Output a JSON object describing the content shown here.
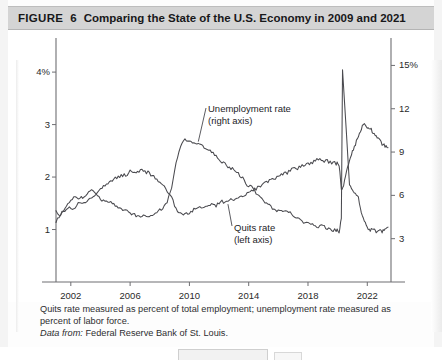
{
  "figure": {
    "label": "FIGURE",
    "number": "6",
    "title": "Comparing the State of the U.S. Economy in 2009 and 2021"
  },
  "caption": {
    "note": "Quits rate measured as percent of total employment; unemployment rate measured as percent of labor force.",
    "source_prefix": "Data from:",
    "source": "Federal Reserve Bank of St. Louis."
  },
  "annotations": {
    "unemployment": {
      "line1": "Unemployment rate",
      "line2": "(right axis)"
    },
    "quits": {
      "line1": "Quits rate",
      "line2": "(left axis)"
    }
  },
  "colors": {
    "header_bg": "#d4d4d4",
    "line": "#4a4a4f",
    "axis": "#6e6e72",
    "text": "#18181a"
  },
  "chart_data": {
    "type": "line",
    "title": "Comparing the State of the U.S. Economy in 2009 and 2021",
    "xlabel": "",
    "ylabel_left": "Quits rate (% of total employment)",
    "ylabel_right": "Unemployment rate (% of labor force)",
    "grid": false,
    "legend": "inline-annotations",
    "xlim": [
      2001.0,
      2023.6
    ],
    "xticks": [
      "2002",
      "2006",
      "2010",
      "2014",
      "2018",
      "2022"
    ],
    "xtick_values": [
      2002,
      2006,
      2010,
      2014,
      2018,
      2022
    ],
    "left_axis": {
      "ticks": [
        "4%",
        "3",
        "2",
        "1"
      ],
      "tick_values": [
        4,
        3,
        2,
        1
      ],
      "ylim": [
        0,
        4.65
      ]
    },
    "right_axis": {
      "ticks": [
        "15%",
        "12",
        "9",
        "6",
        "3"
      ],
      "tick_values": [
        15,
        12,
        9,
        6,
        3
      ],
      "ylim": [
        0,
        16.9
      ]
    },
    "series": [
      {
        "name": "Quits rate (left axis)",
        "axis": "left",
        "units": "percent of total employment",
        "x": [
          2001.0,
          2001.3,
          2001.6,
          2001.9,
          2002.2,
          2002.5,
          2002.8,
          2003.1,
          2003.4,
          2003.7,
          2004.0,
          2004.3,
          2004.6,
          2004.9,
          2005.2,
          2005.5,
          2005.8,
          2006.1,
          2006.4,
          2006.7,
          2007.0,
          2007.3,
          2007.6,
          2007.9,
          2008.2,
          2008.5,
          2008.8,
          2009.1,
          2009.4,
          2009.7,
          2010.0,
          2010.3,
          2010.6,
          2010.9,
          2011.2,
          2011.5,
          2011.8,
          2012.1,
          2012.4,
          2012.7,
          2013.0,
          2013.3,
          2013.6,
          2013.9,
          2014.2,
          2014.5,
          2014.8,
          2015.1,
          2015.4,
          2015.7,
          2016.0,
          2016.3,
          2016.6,
          2016.9,
          2017.2,
          2017.5,
          2017.8,
          2018.1,
          2018.4,
          2018.7,
          2019.0,
          2019.3,
          2019.6,
          2019.9,
          2020.1,
          2020.25,
          2020.4,
          2020.6,
          2020.8,
          2021.0,
          2021.2,
          2021.4,
          2021.6,
          2021.8,
          2022.0,
          2022.2,
          2022.4,
          2022.6,
          2022.8,
          2023.0,
          2023.2,
          2023.4
        ],
        "y": [
          1.33,
          1.28,
          1.35,
          1.42,
          1.4,
          1.48,
          1.52,
          1.55,
          1.62,
          1.7,
          1.78,
          1.85,
          1.92,
          1.96,
          2.02,
          2.02,
          2.06,
          2.12,
          2.1,
          2.14,
          2.1,
          2.08,
          2.0,
          1.94,
          1.84,
          1.74,
          1.6,
          1.4,
          1.3,
          1.28,
          1.32,
          1.38,
          1.42,
          1.4,
          1.45,
          1.48,
          1.46,
          1.52,
          1.54,
          1.56,
          1.58,
          1.62,
          1.64,
          1.68,
          1.72,
          1.78,
          1.82,
          1.88,
          1.92,
          1.96,
          2.02,
          2.06,
          2.08,
          2.14,
          2.16,
          2.2,
          2.24,
          2.26,
          2.3,
          2.34,
          2.32,
          2.3,
          2.28,
          2.26,
          2.24,
          1.78,
          1.82,
          2.1,
          2.3,
          2.48,
          2.62,
          2.78,
          2.92,
          3.02,
          2.96,
          2.92,
          2.86,
          2.8,
          2.74,
          2.64,
          2.58,
          2.56
        ]
      },
      {
        "name": "Unemployment rate (right axis)",
        "axis": "right",
        "units": "percent of labor force",
        "x": [
          2001.0,
          2001.3,
          2001.6,
          2001.9,
          2002.2,
          2002.5,
          2002.8,
          2003.1,
          2003.4,
          2003.7,
          2004.0,
          2004.3,
          2004.6,
          2004.9,
          2005.2,
          2005.5,
          2005.8,
          2006.1,
          2006.4,
          2006.7,
          2007.0,
          2007.3,
          2007.6,
          2007.9,
          2008.2,
          2008.5,
          2008.8,
          2009.1,
          2009.4,
          2009.7,
          2010.0,
          2010.3,
          2010.6,
          2010.9,
          2011.2,
          2011.5,
          2011.8,
          2012.1,
          2012.4,
          2012.7,
          2013.0,
          2013.3,
          2013.6,
          2013.9,
          2014.2,
          2014.5,
          2014.8,
          2015.1,
          2015.4,
          2015.7,
          2016.0,
          2016.3,
          2016.6,
          2016.9,
          2017.2,
          2017.5,
          2017.8,
          2018.1,
          2018.4,
          2018.7,
          2019.0,
          2019.3,
          2019.6,
          2019.9,
          2020.1,
          2020.25,
          2020.33,
          2020.42,
          2020.6,
          2020.8,
          2021.0,
          2021.2,
          2021.4,
          2021.6,
          2021.8,
          2022.0,
          2022.2,
          2022.4,
          2022.6,
          2022.8,
          2023.0,
          2023.2,
          2023.4
        ],
        "y": [
          4.2,
          4.7,
          5.0,
          5.6,
          5.8,
          5.8,
          5.9,
          6.1,
          6.3,
          6.1,
          5.7,
          5.6,
          5.5,
          5.4,
          5.2,
          5.0,
          5.0,
          4.7,
          4.6,
          4.5,
          4.6,
          4.5,
          4.7,
          4.9,
          5.1,
          5.6,
          6.5,
          8.3,
          9.4,
          9.9,
          9.8,
          9.6,
          9.5,
          9.4,
          9.1,
          9.0,
          8.7,
          8.3,
          8.2,
          7.9,
          7.8,
          7.5,
          7.2,
          6.7,
          6.6,
          6.2,
          5.8,
          5.5,
          5.3,
          5.0,
          4.9,
          4.9,
          4.9,
          4.7,
          4.4,
          4.3,
          4.1,
          4.0,
          3.9,
          3.8,
          3.9,
          3.7,
          3.6,
          3.6,
          3.5,
          4.4,
          14.7,
          13.2,
          10.2,
          6.7,
          6.4,
          6.1,
          5.8,
          4.8,
          4.2,
          3.8,
          3.6,
          3.6,
          3.5,
          3.6,
          3.5,
          3.6,
          3.8
        ]
      }
    ],
    "annotations": [
      {
        "text": "Unemployment rate (right axis)",
        "x": 2011.0,
        "y": 12.9,
        "axis": "right"
      },
      {
        "text": "Quits rate (left axis)",
        "x": 2014.2,
        "y": 1.08,
        "axis": "left"
      }
    ]
  }
}
